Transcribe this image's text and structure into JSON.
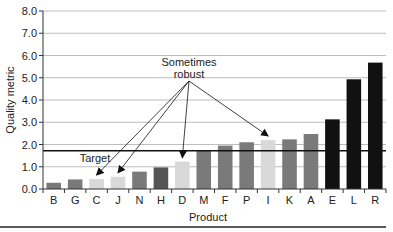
{
  "chart_data": {
    "type": "bar",
    "title": "",
    "xlabel": "Product",
    "ylabel": "Quality metric",
    "ylim": [
      0,
      8
    ],
    "yticks": [
      "0.0",
      "1.0",
      "2.0",
      "3.0",
      "4.0",
      "5.0",
      "6.0",
      "7.0",
      "8.0"
    ],
    "grid": true,
    "categories": [
      "B",
      "G",
      "C",
      "J",
      "N",
      "H",
      "D",
      "M",
      "F",
      "P",
      "I",
      "K",
      "A",
      "E",
      "L",
      "R"
    ],
    "values": [
      0.28,
      0.43,
      0.45,
      0.55,
      0.78,
      0.97,
      1.23,
      1.71,
      1.95,
      2.1,
      2.2,
      2.23,
      2.47,
      3.13,
      4.93,
      5.68
    ],
    "bar_shades": [
      "medium",
      "medium",
      "light",
      "light",
      "medium",
      "dark",
      "light",
      "medium",
      "medium",
      "medium",
      "light",
      "medium",
      "medium",
      "black",
      "black",
      "black"
    ],
    "target": {
      "label": "Target",
      "value": 1.72
    },
    "annotation": {
      "lines": [
        "Sometimes",
        "robust"
      ],
      "points_to": [
        "C",
        "J",
        "D",
        "I"
      ]
    }
  },
  "colors": {
    "light": "#d9d9d9",
    "medium": "#7a7a7a",
    "dark": "#555555",
    "black": "#111111",
    "grid": "#bdbdbd",
    "axis": "#333333",
    "target_line": "#111111"
  }
}
